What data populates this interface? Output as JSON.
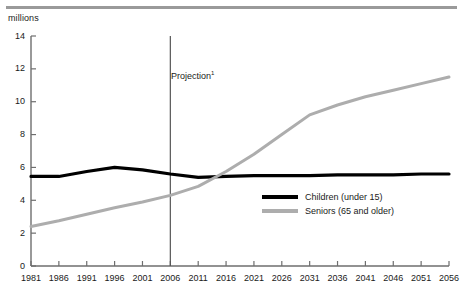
{
  "unit_label": "millions",
  "projection": {
    "label": "Projection",
    "footnote_marker": "1",
    "year": 2006
  },
  "legend": {
    "items": [
      {
        "label": "Children (under 15)",
        "color": "#000000",
        "key": "children"
      },
      {
        "label": "Seniors (65 and older)",
        "color": "#adadad",
        "key": "seniors"
      }
    ]
  },
  "colors": {
    "children_line": "#000000",
    "seniors_line": "#adadad",
    "axis": "#6e6e6e",
    "top_rule": "#9a9a9a",
    "projection_line": "#555555",
    "text": "#1a1a1a",
    "background": "#ffffff"
  },
  "chart_data": {
    "type": "line",
    "title": "",
    "subtitle": "",
    "xlabel": "",
    "ylabel": "millions",
    "grid": false,
    "legend_position": "inside-right",
    "xlim": [
      1981,
      2056
    ],
    "ylim": [
      0,
      14
    ],
    "ytick_labels": [
      "0",
      "2",
      "4",
      "6",
      "8",
      "10",
      "12",
      "14"
    ],
    "yticks": [
      0,
      2,
      4,
      6,
      8,
      10,
      12,
      14
    ],
    "xticks": [
      1981,
      1986,
      1991,
      1996,
      2001,
      2006,
      2011,
      2016,
      2021,
      2026,
      2031,
      2036,
      2041,
      2046,
      2051,
      2056
    ],
    "xtick_labels": [
      "1981",
      "1986",
      "1991",
      "1996",
      "2001",
      "2006",
      "2011",
      "2016",
      "2021",
      "2026",
      "2031",
      "2036",
      "2041",
      "2046",
      "2051",
      "2056"
    ],
    "annotations": [
      {
        "text": "Projection",
        "superscript": "1",
        "x": 2006,
        "type": "vertical-line"
      }
    ],
    "x": [
      1981,
      1986,
      1991,
      1996,
      2001,
      2006,
      2011,
      2016,
      2021,
      2026,
      2031,
      2036,
      2041,
      2046,
      2051,
      2056
    ],
    "series": [
      {
        "name": "Children (under 15)",
        "color": "#000000",
        "values": [
          5.45,
          5.45,
          5.75,
          6.0,
          5.85,
          5.6,
          5.4,
          5.45,
          5.5,
          5.5,
          5.5,
          5.55,
          5.55,
          5.55,
          5.6,
          5.6
        ]
      },
      {
        "name": "Seniors (65 and older)",
        "color": "#adadad",
        "values": [
          2.4,
          2.75,
          3.15,
          3.55,
          3.9,
          4.3,
          4.85,
          5.75,
          6.8,
          8.0,
          9.2,
          9.8,
          10.3,
          10.7,
          11.1,
          11.5
        ]
      }
    ]
  }
}
